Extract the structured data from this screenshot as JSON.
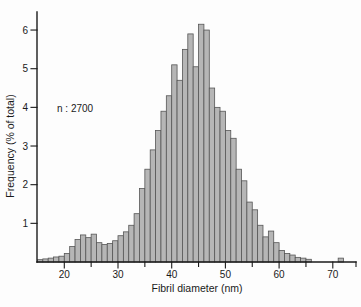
{
  "figure": {
    "ylabel": "Frequency (% of total)",
    "xlabel": "Fibril diameter (nm)",
    "annotation": "n : 2700"
  },
  "chart_data": {
    "type": "bar",
    "subtype": "histogram",
    "title": "",
    "xlabel": "Fibril diameter (nm)",
    "ylabel": "Frequency (% of total)",
    "annotation": "n : 2700",
    "sample_size_n": 2700,
    "bin_width_nm": 1,
    "bin_start_nm": 15,
    "xlim": [
      15,
      75
    ],
    "ylim": [
      0,
      6.5
    ],
    "x_ticks_major": [
      20,
      30,
      40,
      50,
      60,
      70
    ],
    "x_ticks_minor": [
      25,
      35,
      45,
      55,
      65,
      75
    ],
    "y_ticks": [
      1,
      2,
      3,
      4,
      5,
      6
    ],
    "grid": false,
    "legend": false,
    "bar_fill": "#b6b6b6",
    "bar_stroke": "#565656",
    "axis_color": "#1a1a1a",
    "values_percent": [
      0.06,
      0.08,
      0.1,
      0.13,
      0.15,
      0.22,
      0.4,
      0.58,
      0.7,
      0.63,
      0.72,
      0.5,
      0.45,
      0.48,
      0.55,
      0.68,
      0.78,
      0.95,
      1.25,
      1.9,
      2.4,
      2.9,
      3.4,
      3.9,
      4.3,
      5.1,
      4.7,
      5.5,
      5.9,
      5.05,
      6.15,
      6.0,
      4.5,
      4.0,
      3.9,
      3.4,
      3.2,
      2.4,
      2.1,
      1.55,
      1.35,
      0.95,
      0.65,
      0.8,
      0.5,
      0.3,
      0.22,
      0.18,
      0.12,
      0.1,
      0.07,
      0,
      0,
      0,
      0,
      0,
      0.1,
      0,
      0,
      0
    ]
  }
}
